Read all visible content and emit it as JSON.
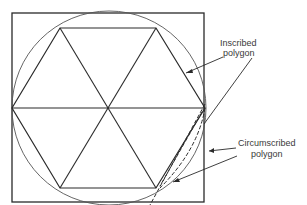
{
  "diagram": {
    "labels": {
      "inscribed_line1": "Inscribed",
      "inscribed_line2": "polygon",
      "circumscribed_line1": "Circumscribed",
      "circumscribed_line2": "polygon"
    },
    "shapes": {
      "square": {
        "x": 12,
        "y": 13,
        "width": 192,
        "height": 189
      },
      "circle": {
        "cx": 109,
        "cy": 108,
        "r": 97
      },
      "hexagon_vertices": [
        [
          12,
          108
        ],
        [
          60,
          28
        ],
        [
          156,
          28
        ],
        [
          205,
          108
        ],
        [
          156,
          188
        ],
        [
          60,
          188
        ]
      ],
      "center": [
        109,
        108
      ]
    },
    "colors": {
      "stroke": "#2a2a2a",
      "circle_stroke": "#555555",
      "label": "#3a3a3a",
      "background": "#ffffff"
    }
  }
}
